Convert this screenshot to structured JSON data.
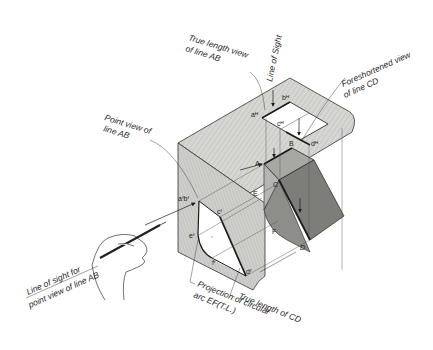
{
  "figure": {
    "colors": {
      "plane_fill": "#d4d4d2",
      "plane_hatch": "#b9b9b6",
      "solid_dark": "#7a7a78",
      "solid_mid": "#9c9c99",
      "solid_light": "#b8b8b5",
      "line": "#1c1c1c",
      "background": "#ffffff"
    }
  },
  "labels": {
    "true_length_ab_1": "True  length view",
    "true_length_ab_2": "of line AB",
    "line_of_sight": "Line of Sight",
    "foreshortened_cd_1": "Foreshortened view",
    "foreshortened_cd_2": "of line CD",
    "point_view_ab_1": "Point  view of",
    "point_view_ab_2": "line AB",
    "line_of_sight_for_1": "Line of sight for",
    "line_of_sight_for_2": "point view of line AB",
    "projection_arc_1": "Projection of circular",
    "projection_arc_2": "arc EF(T.L.)",
    "true_length_cd": "True length of CD"
  },
  "points": {
    "A": "A",
    "B": "B",
    "C": "C",
    "D": "D",
    "E": "E",
    "F": "F",
    "aF_bF": "aᶠbᶠ",
    "cF": "cᶠ",
    "dF": "dᶠ",
    "eF": "eᶠ",
    "fF": "fᶠ",
    "aH": "aᴴ",
    "bH": "bᴴ",
    "cH": "cᴴ",
    "dH": "dᴴ"
  }
}
